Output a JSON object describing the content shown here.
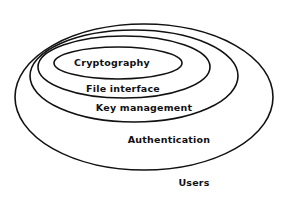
{
  "diagram": {
    "type": "nested-layers",
    "layers": [
      {
        "label": "Users",
        "level": 0
      },
      {
        "label": "Authentication",
        "level": 1
      },
      {
        "label": "Key management",
        "level": 2
      },
      {
        "label": "File interface",
        "level": 3
      },
      {
        "label": "Cryptography",
        "level": 4
      }
    ],
    "stroke_color": "#111111",
    "background_color": "#ffffff"
  }
}
